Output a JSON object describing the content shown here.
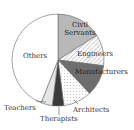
{
  "chart_data": {
    "type": "pie",
    "title": "",
    "categories": [
      "Civil Servants",
      "Engineers",
      "Manufacturers",
      "Architects",
      "Therapists",
      "Teachers",
      "Others"
    ],
    "values": [
      16,
      11,
      11,
      10,
      4,
      4,
      44
    ],
    "unit": "%",
    "start_angle_deg": 0,
    "direction": "clockwise",
    "legend": "none (direct labels)",
    "fills": {
      "Civil Servants": "#b8b8b8 solid",
      "Engineers": "diagonal hatch",
      "Manufacturers": "#6e6e6e solid",
      "Architects": "dotted",
      "Therapists": "#3a3a3a solid",
      "Teachers": "#e4e4e4 solid",
      "Others": "#ffffff"
    }
  },
  "labels": {
    "civil": [
      "Civil",
      "Servants"
    ],
    "engineers": "Engineers",
    "manufacturers": "Manufacturers",
    "architects": "Architects",
    "therapists": "Therapists",
    "teachers": "Teachers",
    "others": "Others"
  }
}
